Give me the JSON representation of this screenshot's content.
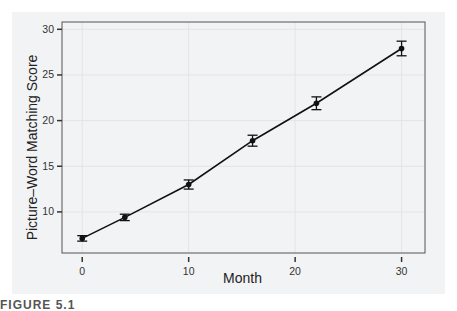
{
  "chart_data": {
    "type": "line",
    "title": "",
    "xlabel": "Month",
    "ylabel": "Picture–Word Matching Score",
    "x": [
      0,
      4,
      10,
      16,
      22,
      30
    ],
    "series": [
      {
        "name": "Picture-Word Matching Score",
        "values": [
          7.1,
          9.4,
          13.0,
          17.8,
          21.9,
          27.9
        ],
        "error": [
          0.3,
          0.35,
          0.5,
          0.6,
          0.7,
          0.8
        ]
      }
    ],
    "xticks": [
      0,
      10,
      20,
      30
    ],
    "yticks": [
      10,
      15,
      20,
      25,
      30
    ],
    "xlim": [
      -1.9,
      32.2
    ],
    "ylim": [
      5.5,
      30.8
    ],
    "grid": true,
    "legend": "none"
  },
  "labels": {
    "xlabel": "Month",
    "ylabel": "Picture–Word Matching Score",
    "caption": "FIGURE 5.1"
  },
  "colors": {
    "line": "#111111",
    "frame": "#555555",
    "grid": "#e2e4e6",
    "panel": "#f2f3f4"
  }
}
